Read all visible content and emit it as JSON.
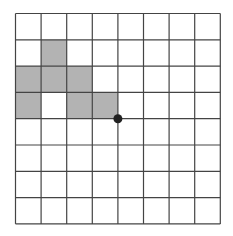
{
  "grid": {
    "rows": 8,
    "cols": 8,
    "left": 15.5,
    "top": 13.5,
    "cell_w": 25.6,
    "cell_h": 26.3,
    "line_color": "#444444",
    "fill_color": "#b3b3b3",
    "background": "#ffffff",
    "shaded_cells": [
      {
        "row": 1,
        "col": 1
      },
      {
        "row": 2,
        "col": 0
      },
      {
        "row": 2,
        "col": 1
      },
      {
        "row": 2,
        "col": 2
      },
      {
        "row": 3,
        "col": 0
      },
      {
        "row": 3,
        "col": 2
      },
      {
        "row": 3,
        "col": 3
      }
    ],
    "dot": {
      "row_line": 4,
      "col_line": 4,
      "radius": 4.5,
      "color": "#222222"
    }
  }
}
